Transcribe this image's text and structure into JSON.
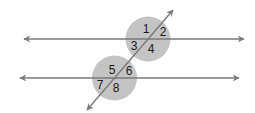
{
  "diagram": {
    "colors": {
      "background": "#ffffff",
      "circle_fill": "#c4c4c4",
      "line": "#7a7a7a",
      "label": "#1a1a1a"
    },
    "lines": {
      "upper": {
        "x1": 24,
        "y1": 39,
        "x2": 244,
        "y2": 39
      },
      "lower": {
        "x1": 20,
        "y1": 78,
        "x2": 239,
        "y2": 78
      },
      "transversal": {
        "x1": 87,
        "y1": 110,
        "x2": 173,
        "y2": 10
      }
    },
    "circles": [
      {
        "cx": 148,
        "cy": 39,
        "r": 22.5
      },
      {
        "cx": 114.5,
        "cy": 78,
        "r": 22.5
      }
    ],
    "angle_labels": [
      {
        "text": "1",
        "x": 146,
        "y": 33
      },
      {
        "text": "2",
        "x": 163,
        "y": 36
      },
      {
        "text": "3",
        "x": 134,
        "y": 50
      },
      {
        "text": "4",
        "x": 151,
        "y": 53
      },
      {
        "text": "5",
        "x": 112,
        "y": 74
      },
      {
        "text": "6",
        "x": 129,
        "y": 75
      },
      {
        "text": "7",
        "x": 100,
        "y": 89
      },
      {
        "text": "8",
        "x": 116,
        "y": 92
      }
    ]
  }
}
